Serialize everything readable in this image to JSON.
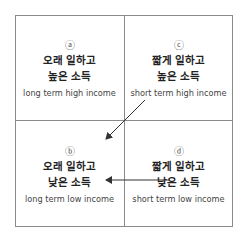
{
  "quadrants": {
    "a": {
      "mark": "ⓐ",
      "ko_line1": "오래 일하고",
      "ko_line2": "높은 소득",
      "en": "long term high income"
    },
    "c": {
      "mark": "ⓒ",
      "ko_line1": "짧게 일하고",
      "ko_line2": "높은 소득",
      "en": "short term high income"
    },
    "b": {
      "mark": "ⓑ",
      "ko_line1": "오래 일하고",
      "ko_line2": "낮은 소득",
      "en": "long term low income"
    },
    "d": {
      "mark": "ⓓ",
      "ko_line1": "짧게 일하고",
      "ko_line2": "낮은 소득",
      "en": "short term low income"
    }
  },
  "arrows": [
    {
      "from": "c",
      "to": "b",
      "direction": "diagonal"
    },
    {
      "from": "d",
      "to": "b",
      "direction": "horizontal"
    }
  ],
  "colors": {
    "line": "#8a8a8a",
    "arrow": "#333333",
    "text": "#222222"
  }
}
